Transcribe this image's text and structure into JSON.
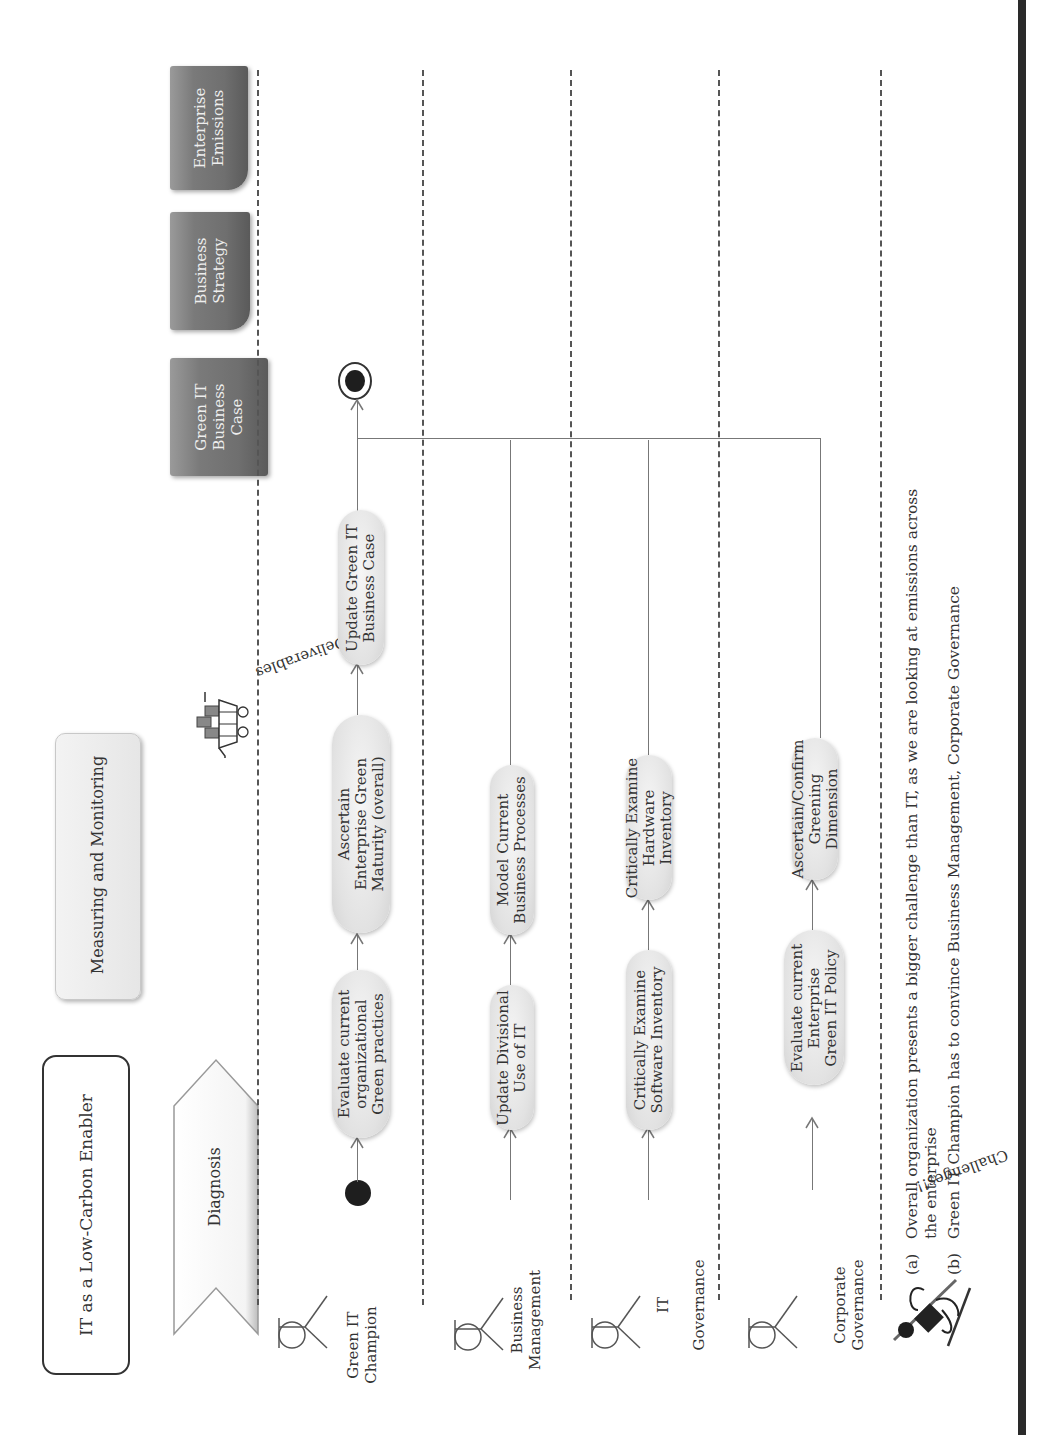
{
  "title_box": {
    "label": "IT as a Low-Carbon Enabler"
  },
  "phase": {
    "label": "Diagnosis"
  },
  "stage_box": {
    "label": "Measuring and Monitoring"
  },
  "deliverables": {
    "label": "Deliverables",
    "items": [
      {
        "label": "Green IT\nBusiness\nCase"
      },
      {
        "label": "Business\nStrategy"
      },
      {
        "label": "Enterprise\nEmissions"
      }
    ]
  },
  "swimlanes": [
    {
      "actor": "Green IT\nChampion",
      "activities": [
        {
          "label": "Evaluate current\norganizational\nGreen practices"
        },
        {
          "label": "Ascertain\nEnterprise Green\nMaturity (overall)"
        },
        {
          "label": "Update Green IT\nBusiness Case"
        }
      ]
    },
    {
      "actor": "Business\nManagement",
      "activities": [
        {
          "label": "Update Divisional\nUse of IT"
        },
        {
          "label": "Model Current\nBusiness Processes"
        }
      ]
    },
    {
      "actor": "IT\n\nGovernance",
      "activities": [
        {
          "label": "Critically Examine\nSoftware Inventory"
        },
        {
          "label": "Critically Examine\nHardware Inventory"
        }
      ]
    },
    {
      "actor": "Corporate\nGovernance",
      "activities": [
        {
          "label": "Evaluate current\nEnterprise\nGreen IT Policy"
        },
        {
          "label": "Ascertain/Confirm\nGreening Dimension"
        }
      ]
    }
  ],
  "challenges": {
    "label": "Challenges!!",
    "items": [
      {
        "marker": "(a)",
        "text": "Overall organization  presents a bigger challenge than IT, as we are looking at emissions across",
        "cont": "the enterprise"
      },
      {
        "marker": "(b)",
        "text": "Green IT Champion has to convince Business Management, Corporate Governance"
      }
    ]
  },
  "colors": {
    "line": "#777777",
    "dash": "#555555",
    "doc": "#777777",
    "activity": "#e2e2e2",
    "bar": "#2a2a2a"
  }
}
